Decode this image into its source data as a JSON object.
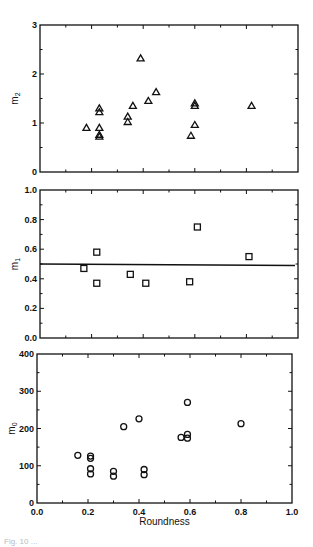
{
  "chart_data": [
    {
      "type": "scatter",
      "panel": "top",
      "ylabel": "m2",
      "xlabel": "",
      "xlim": [
        0.0,
        1.0
      ],
      "ylim": [
        0,
        3
      ],
      "yticks": [
        "0",
        "1",
        "2",
        "3"
      ],
      "marker": "triangle",
      "grid": false,
      "series": [
        {
          "name": "m2",
          "x": [
            0.18,
            0.23,
            0.23,
            0.23,
            0.23,
            0.23,
            0.34,
            0.34,
            0.36,
            0.39,
            0.42,
            0.45,
            0.585,
            0.6,
            0.6,
            0.6,
            0.82
          ],
          "y": [
            0.9,
            1.3,
            1.22,
            0.9,
            0.76,
            0.72,
            1.13,
            1.02,
            1.35,
            2.32,
            1.45,
            1.63,
            0.74,
            0.96,
            1.35,
            1.4,
            1.35
          ]
        }
      ]
    },
    {
      "type": "scatter",
      "panel": "middle",
      "ylabel": "m1",
      "xlabel": "",
      "xlim": [
        0.0,
        1.0
      ],
      "ylim": [
        0.0,
        1.0
      ],
      "yticks": [
        "0.0",
        "0.2",
        "0.4",
        "0.6",
        "0.8",
        "1.0"
      ],
      "marker": "square",
      "grid": false,
      "series": [
        {
          "name": "m1",
          "x": [
            0.17,
            0.22,
            0.22,
            0.35,
            0.41,
            0.58,
            0.61,
            0.81
          ],
          "y": [
            0.47,
            0.58,
            0.37,
            0.43,
            0.37,
            0.38,
            0.75,
            0.55
          ]
        }
      ],
      "fit_line": {
        "x": [
          0.0,
          1.0
        ],
        "y": [
          0.5,
          0.49
        ]
      }
    },
    {
      "type": "scatter",
      "panel": "bottom",
      "ylabel": "m0",
      "xlabel": "Roundness",
      "xlim": [
        0.0,
        1.0
      ],
      "ylim": [
        0,
        400
      ],
      "xticks": [
        "0.0",
        "0.2",
        "0.4",
        "0.6",
        "0.8",
        "1.0"
      ],
      "yticks": [
        "0",
        "100",
        "200",
        "300",
        "400"
      ],
      "marker": "circle",
      "grid": false,
      "series": [
        {
          "name": "m0",
          "x": [
            0.16,
            0.21,
            0.21,
            0.21,
            0.21,
            0.3,
            0.3,
            0.34,
            0.4,
            0.42,
            0.42,
            0.565,
            0.59,
            0.59,
            0.59,
            0.8
          ],
          "y": [
            128,
            126,
            120,
            92,
            78,
            85,
            72,
            205,
            226,
            90,
            76,
            176,
            184,
            174,
            270,
            213
          ]
        }
      ]
    }
  ],
  "labels": {
    "top_ylabel_base": "m",
    "top_ylabel_sub": "2",
    "mid_ylabel_base": "m",
    "mid_ylabel_sub": "1",
    "bot_ylabel_base": "m",
    "bot_ylabel_sub": "0",
    "xlabel": "Roundness",
    "caption": "Fig. 10 ..."
  }
}
